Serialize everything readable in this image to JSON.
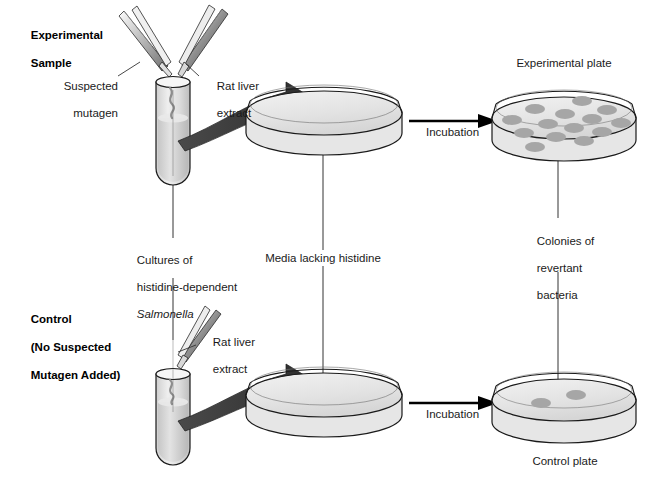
{
  "figure": {
    "background_color": "#ffffff"
  },
  "colors": {
    "outline": "#1a1a1a",
    "glass_fill": "#e8e8e8",
    "medium_fill": "#d0d0d0",
    "colony_fill": "#a6a6a6",
    "arrow_dark": "#333333",
    "text": "#1a1a1a",
    "plate_fill": "#ececec"
  },
  "rows": {
    "experimental": {
      "heading_line1": "Experimental",
      "heading_line2": "Sample",
      "left_dropper_label_line1": "Suspected",
      "left_dropper_label_line2": "mutagen",
      "right_dropper_label_line1": "Rat liver",
      "right_dropper_label_line2": "extract",
      "incubation_label": "Incubation",
      "plate_label": "Experimental plate",
      "colony_count": 14
    },
    "control": {
      "heading_line1": "Control",
      "heading_line2": "(No Suspected",
      "heading_line3": "Mutagen Added)",
      "right_dropper_label_line1": "Rat liver",
      "right_dropper_label_line2": "extract",
      "incubation_label": "Incubation",
      "plate_label": "Control plate",
      "colony_count": 2
    }
  },
  "annotations": {
    "cultures_line1": "Cultures of",
    "cultures_line2": "histidine-dependent",
    "cultures_line3": "Salmonella",
    "media_label": "Media lacking histidine",
    "colonies_line1": "Colonies of",
    "colonies_line2": "revertant",
    "colonies_line3": "bacteria"
  },
  "experimental_colonies": [
    {
      "cx": 582,
      "cy": 101,
      "rx": 10,
      "ry": 5
    },
    {
      "cx": 535,
      "cy": 109,
      "rx": 10,
      "ry": 5
    },
    {
      "cx": 607,
      "cy": 110,
      "rx": 10,
      "ry": 5
    },
    {
      "cx": 565,
      "cy": 114,
      "rx": 10,
      "ry": 5
    },
    {
      "cx": 512,
      "cy": 120,
      "rx": 10,
      "ry": 5
    },
    {
      "cx": 592,
      "cy": 119,
      "rx": 10,
      "ry": 5
    },
    {
      "cx": 548,
      "cy": 124,
      "rx": 10,
      "ry": 5
    },
    {
      "cx": 621,
      "cy": 123,
      "rx": 10,
      "ry": 5
    },
    {
      "cx": 574,
      "cy": 128,
      "rx": 10,
      "ry": 5
    },
    {
      "cx": 524,
      "cy": 133,
      "rx": 10,
      "ry": 5
    },
    {
      "cx": 602,
      "cy": 132,
      "rx": 10,
      "ry": 5
    },
    {
      "cx": 556,
      "cy": 137,
      "rx": 10,
      "ry": 5
    },
    {
      "cx": 584,
      "cy": 141,
      "rx": 10,
      "ry": 5
    },
    {
      "cx": 535,
      "cy": 147,
      "rx": 10,
      "ry": 5
    }
  ],
  "control_colonies": [
    {
      "cx": 541,
      "cy": 403,
      "rx": 10,
      "ry": 5
    },
    {
      "cx": 576,
      "cy": 395,
      "rx": 10,
      "ry": 5
    }
  ]
}
